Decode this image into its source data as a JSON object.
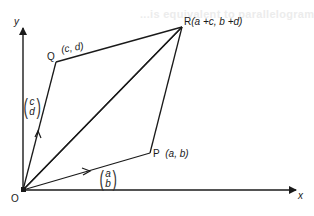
{
  "diagram": {
    "background_text": "...is equivalent to parallelogram law...",
    "axes": {
      "x_label": "x",
      "y_label": "y",
      "origin_label": "O"
    },
    "points": {
      "O": {
        "label": "O"
      },
      "P": {
        "label": "P",
        "coords": "(a, b)"
      },
      "Q": {
        "label": "Q",
        "coords": "(c, d)"
      },
      "R": {
        "label": "R",
        "coords": "(a +c, b +d)"
      }
    },
    "vectors": {
      "OP": {
        "top": "a",
        "bottom": "b"
      },
      "OQ": {
        "top": "c",
        "bottom": "d"
      }
    },
    "colors": {
      "line": "#1a1a1a",
      "background": "#ffffff"
    }
  }
}
